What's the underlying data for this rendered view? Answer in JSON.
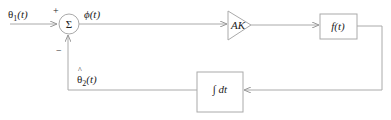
{
  "diagram": {
    "input_label": "θ1(t)",
    "input_main": "θ",
    "input_sub": "1",
    "input_arg": "(t)",
    "plus_sign": "+",
    "minus_sign": "−",
    "sum_symbol": "Σ",
    "error_label": "ϕ(t)",
    "gain_label": "AK",
    "filter_label": "f(t)",
    "integrator_label": "∫ dt",
    "feedback_main": "θ",
    "feedback_hat": "^",
    "feedback_sub": "2",
    "feedback_arg": "(t)",
    "line_color": "#aaaaaa"
  }
}
